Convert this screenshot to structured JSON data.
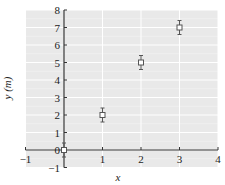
{
  "chart_data": {
    "type": "scatter",
    "title": "",
    "xlabel": "x",
    "ylabel": "y (m)",
    "xlim": [
      -1,
      4
    ],
    "ylim": [
      -1,
      8
    ],
    "grid": true,
    "legend": null,
    "x_ticks": [
      -1,
      0,
      1,
      2,
      3,
      4
    ],
    "y_ticks": [
      -1,
      0,
      1,
      2,
      3,
      4,
      5,
      6,
      7,
      8
    ],
    "x_tick_labels": [
      "-1",
      "0",
      "1",
      "2",
      "3",
      "4"
    ],
    "y_tick_labels": [
      "-1",
      "0",
      "1",
      "2",
      "3",
      "4",
      "5",
      "6",
      "7",
      "8"
    ],
    "series": [
      {
        "name": "data",
        "marker": "open-square",
        "x": [
          0,
          1,
          2,
          3
        ],
        "y": [
          0,
          2,
          5,
          7
        ],
        "yerr": [
          0.4,
          0.4,
          0.4,
          0.4
        ]
      }
    ]
  },
  "colors": {
    "plot_background": "#e9e9e9",
    "grid": "#ffffff",
    "axis": "#333333",
    "marker": "#555555"
  },
  "layout": {
    "x0_px": 64,
    "y0_px": 150,
    "px_per_x": 38.5,
    "px_per_y": 17.5
  }
}
